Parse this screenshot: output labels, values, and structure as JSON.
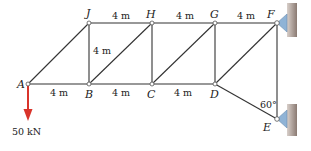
{
  "figure": {
    "type": "truss",
    "joints": [
      {
        "id": "A",
        "label": "A"
      },
      {
        "id": "B",
        "label": "B"
      },
      {
        "id": "C",
        "label": "C"
      },
      {
        "id": "D",
        "label": "D"
      },
      {
        "id": "E",
        "label": "E"
      },
      {
        "id": "F",
        "label": "F"
      },
      {
        "id": "G",
        "label": "G"
      },
      {
        "id": "H",
        "label": "H"
      },
      {
        "id": "J",
        "label": "J"
      }
    ],
    "members": [
      "AB",
      "BC",
      "CD",
      "JH",
      "HG",
      "GF",
      "AJ",
      "JB",
      "BH",
      "HC",
      "CG",
      "GD",
      "DF",
      "FE",
      "DE"
    ],
    "dimensions": {
      "JH": "4 m",
      "HG": "4 m",
      "GF": "4 m",
      "JB": "4 m",
      "AB": "4 m",
      "BC": "4 m",
      "CD": "4 m"
    },
    "angle_label": "60°",
    "load": {
      "label": "50 kN",
      "at": "A",
      "direction": "down",
      "color": "#d9342b"
    },
    "supports": [
      {
        "at": "F",
        "type": "pin-to-wall",
        "color": "#8fb3d6"
      },
      {
        "at": "E",
        "type": "pin-to-wall",
        "color": "#8fb3d6"
      }
    ],
    "wall_color": "#8a7a72"
  }
}
